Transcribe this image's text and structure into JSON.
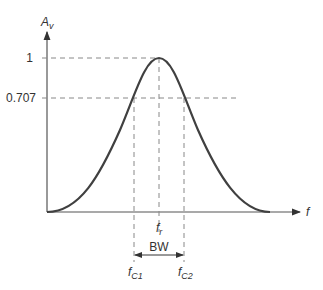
{
  "diagram": {
    "y_axis_label": "A",
    "y_axis_sub": "v",
    "x_axis_label": "f",
    "y_ticks": [
      {
        "label": "1",
        "value": 1.0
      },
      {
        "label": "0.707",
        "value": 0.707
      }
    ],
    "markers": {
      "fr": {
        "main": "f",
        "sub": "r"
      },
      "fc1": {
        "main": "f",
        "sub": "C1"
      },
      "fc2": {
        "main": "f",
        "sub": "C2"
      }
    },
    "bandwidth_label": "BW",
    "colors": {
      "curve": "#404040",
      "axis": "#555555",
      "dash": "#888888"
    }
  }
}
